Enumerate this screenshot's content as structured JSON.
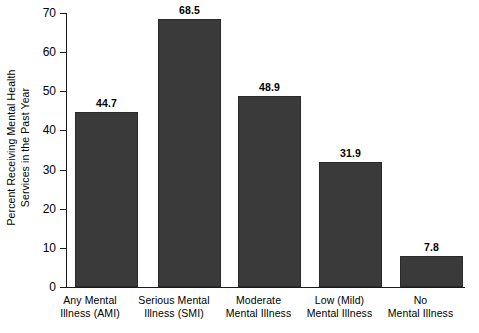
{
  "chart_data": {
    "type": "bar",
    "title": "",
    "subtitle": "",
    "xlabel": "",
    "ylabel": "Percent Receiving Mental Health Services in the Past Year",
    "ylabel_lines": [
      "Percent Receiving Mental Health",
      "Services in the Past Year"
    ],
    "categories": [
      "Any Mental Illness (AMI)",
      "Serious Mental Illness (SMI)",
      "Moderate Mental Illness",
      "Low (Mild) Mental Illness",
      "No Mental Illness"
    ],
    "category_lines": [
      [
        "Any Mental",
        "Illness (AMI)"
      ],
      [
        "Serious Mental",
        "Illness (SMI)"
      ],
      [
        "Moderate",
        "Mental Illness"
      ],
      [
        "Low (Mild)",
        "Mental Illness"
      ],
      [
        "No",
        "Mental Illness"
      ]
    ],
    "values": [
      44.7,
      68.5,
      48.9,
      31.9,
      7.8
    ],
    "value_labels": [
      "44.7",
      "68.5",
      "48.9",
      "31.9",
      "7.8"
    ],
    "ylim": [
      0,
      70
    ],
    "ytick_values": [
      0,
      10,
      20,
      30,
      40,
      50,
      60,
      70
    ],
    "ytick_labels": [
      "0",
      "10",
      "20",
      "30",
      "40",
      "50",
      "60",
      "70"
    ],
    "grid": false,
    "legend": false,
    "legend_position": "none",
    "bar_color": "#3a3a3a",
    "axis_color": "#1a1a1a",
    "background_color": "#ffffff"
  }
}
